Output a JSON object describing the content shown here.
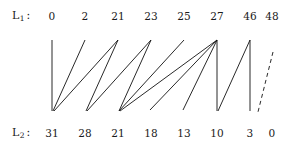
{
  "figure": {
    "kind": "bipartite-correspondence-diagram",
    "width": 288,
    "height": 152,
    "background_color": "#ffffff",
    "line_color": "#111111"
  },
  "top_row": {
    "label_letter": "L",
    "label_subscript": "1",
    "label_colon": ":",
    "label_full": "L1:",
    "values": [
      "0",
      "2",
      "21",
      "23",
      "25",
      "27",
      "46",
      "48"
    ]
  },
  "bottom_row": {
    "label_letter": "L",
    "label_subscript": "2",
    "label_colon": ":",
    "label_full": "L2:",
    "values": [
      "31",
      "28",
      "21",
      "18",
      "13",
      "10",
      "3",
      "0"
    ]
  },
  "geometry": {
    "column_x": [
      52,
      85,
      118,
      151,
      184,
      217,
      250,
      272
    ],
    "top_y": 40,
    "bottom_y": 111,
    "node_count": 8
  },
  "edges": [
    {
      "from_column": 1,
      "to_column": 1,
      "style": "solid",
      "x1": 52,
      "y1": 40,
      "x2": 52,
      "y2": 111
    },
    {
      "from_column": 2,
      "to_column": 1,
      "style": "solid",
      "x1": 85,
      "y1": 40,
      "x2": 53,
      "y2": 111
    },
    {
      "from_column": 3,
      "to_column": 1,
      "style": "solid",
      "x1": 118,
      "y1": 40,
      "x2": 54,
      "y2": 111
    },
    {
      "from_column": 3,
      "to_column": 2,
      "style": "solid",
      "x1": 118,
      "y1": 40,
      "x2": 86,
      "y2": 111
    },
    {
      "from_column": 4,
      "to_column": 2,
      "style": "solid",
      "x1": 151,
      "y1": 40,
      "x2": 87,
      "y2": 111
    },
    {
      "from_column": 4,
      "to_column": 3,
      "style": "solid",
      "x1": 151,
      "y1": 40,
      "x2": 119,
      "y2": 111
    },
    {
      "from_column": 5,
      "to_column": 3,
      "style": "solid",
      "x1": 184,
      "y1": 40,
      "x2": 119,
      "y2": 111
    },
    {
      "from_column": 6,
      "to_column": 3,
      "style": "solid",
      "x1": 217,
      "y1": 40,
      "x2": 120,
      "y2": 111
    },
    {
      "from_column": 6,
      "to_column": 4,
      "style": "solid",
      "x1": 217,
      "y1": 40,
      "x2": 150,
      "y2": 110
    },
    {
      "from_column": 6,
      "to_column": 5,
      "style": "solid",
      "x1": 217,
      "y1": 40,
      "x2": 183,
      "y2": 110
    },
    {
      "from_column": 6,
      "to_column": 6,
      "style": "solid",
      "x1": 217,
      "y1": 40,
      "x2": 217,
      "y2": 111
    },
    {
      "from_column": 7,
      "to_column": 6,
      "style": "solid",
      "x1": 250,
      "y1": 40,
      "x2": 218,
      "y2": 111
    },
    {
      "from_column": 7,
      "to_column": 7,
      "style": "solid",
      "x1": 250,
      "y1": 40,
      "x2": 250,
      "y2": 111
    },
    {
      "from_column": 8,
      "to_column": 7,
      "style": "dashed",
      "x1": 273,
      "y1": 52,
      "x2": 258,
      "y2": 112
    }
  ]
}
